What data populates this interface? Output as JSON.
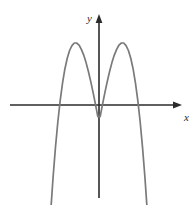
{
  "figure": {
    "width": 196,
    "height": 205,
    "background_color": "#ffffff",
    "axis_color": "#2b2b2b",
    "curve_color": "#7a7a7a"
  },
  "axes": {
    "x_label": "x",
    "y_label": "y",
    "x_axis_y_pixel": 105,
    "y_axis_x_pixel": 99,
    "x_axis_start_pixel": 10,
    "x_axis_end_pixel": 182,
    "y_axis_top_pixel": 15,
    "y_axis_bottom_pixel": 198,
    "ticks": [],
    "tick_labels": [],
    "grid": false
  },
  "chart_data": {
    "type": "line",
    "title": "",
    "subtitle": "",
    "xlabel": "x",
    "ylabel": "y",
    "grid": false,
    "legend": [],
    "legend_position": "none",
    "xlim": [
      -3,
      3
    ],
    "ylim": [
      -3.2,
      3.6
    ],
    "series": [
      {
        "name": "quartic",
        "color": "#7a7a7a",
        "x": [
          -2.04,
          -1.95,
          -1.85,
          -1.75,
          -1.65,
          -1.55,
          -1.45,
          -1.35,
          -1.25,
          -1.15,
          -1.05,
          -0.95,
          -0.85,
          -0.75,
          -0.65,
          -0.55,
          -0.45,
          -0.35,
          -0.25,
          -0.15,
          -0.05,
          0.05,
          0.15,
          0.25,
          0.35,
          0.45,
          0.55,
          0.65,
          0.75,
          0.85,
          0.95,
          1.05,
          1.15,
          1.25,
          1.35,
          1.45,
          1.55,
          1.65,
          1.75,
          1.85,
          1.95,
          2.04
        ],
        "y": [
          3.55,
          2.49,
          1.47,
          0.59,
          -0.15,
          -0.76,
          -1.25,
          -1.62,
          -1.89,
          -2.06,
          -2.15,
          -2.15,
          -2.08,
          -1.93,
          -1.73,
          -1.47,
          -1.16,
          -0.81,
          -0.43,
          -0.02,
          0.4,
          0.4,
          -0.02,
          -0.43,
          -0.81,
          -1.16,
          -1.47,
          -1.73,
          -1.93,
          -2.08,
          -2.15,
          -2.15,
          -2.06,
          -1.89,
          -1.62,
          -1.25,
          -0.76,
          -0.15,
          0.59,
          1.47,
          2.49,
          3.55
        ]
      }
    ],
    "key_points": {
      "x_intercepts": [
        -1.7,
        -0.6,
        0.6,
        1.7
      ],
      "local_maximum": {
        "x": 0,
        "y": 0.44
      },
      "local_minima": [
        {
          "x": -1.0,
          "y": -2.15
        },
        {
          "x": 1.0,
          "y": -2.15
        }
      ]
    }
  }
}
